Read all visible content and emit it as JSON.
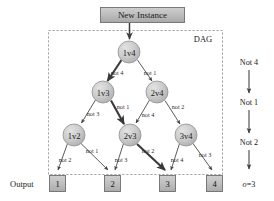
{
  "figure": {
    "background": "#ffffff",
    "node_fill": "#c6c6c6",
    "node_stroke": "#8f8f8f",
    "box_fill": "#b9b9b9",
    "box_stroke": "#7a7a7a",
    "edge_color": "#4a4a4a",
    "dashed_color": "#9a9a9a"
  },
  "input_box": {
    "label": "New Instance"
  },
  "dag_region": {
    "label": "DAG"
  },
  "output_label": {
    "text": "Output"
  },
  "nodes": [
    {
      "id": "n1v4",
      "label": "1v4",
      "cx": 129,
      "cy": 52
    },
    {
      "id": "n1v3",
      "label": "1v3",
      "cx": 103,
      "cy": 92
    },
    {
      "id": "n2v4",
      "label": "2v4",
      "cx": 157,
      "cy": 92
    },
    {
      "id": "n1v2",
      "label": "1v2",
      "cx": 74,
      "cy": 135
    },
    {
      "id": "n2v3",
      "label": "2v3",
      "cx": 130,
      "cy": 135
    },
    {
      "id": "n3v4",
      "label": "3v4",
      "cx": 186,
      "cy": 135
    }
  ],
  "outputs": [
    {
      "label": "1",
      "x": 56
    },
    {
      "label": "2",
      "x": 111
    },
    {
      "label": "3",
      "x": 166
    },
    {
      "label": "4",
      "x": 213
    }
  ],
  "edges": [
    {
      "from": "new-instance",
      "to": "n1v4",
      "label": "",
      "bold": false
    },
    {
      "from": "n1v4",
      "to": "n1v3",
      "label": "not 4",
      "bold": true
    },
    {
      "from": "n1v4",
      "to": "n2v4",
      "label": "not 1",
      "bold": false
    },
    {
      "from": "n1v3",
      "to": "n1v2",
      "label": "not 3",
      "bold": false
    },
    {
      "from": "n1v3",
      "to": "n2v3",
      "label": "not 1",
      "bold": true
    },
    {
      "from": "n2v4",
      "to": "n2v3",
      "label": "not 4",
      "bold": false
    },
    {
      "from": "n2v4",
      "to": "n3v4",
      "label": "not 2",
      "bold": false
    },
    {
      "from": "n1v2",
      "to": "out1",
      "label": "not 2",
      "bold": false
    },
    {
      "from": "n1v2",
      "to": "out2",
      "label": "not 1",
      "bold": false
    },
    {
      "from": "n2v3",
      "to": "out2",
      "label": "not 3",
      "bold": false
    },
    {
      "from": "n2v3",
      "to": "out3",
      "label": "not 2",
      "bold": true
    },
    {
      "from": "n3v4",
      "to": "out3",
      "label": "not 4",
      "bold": false
    },
    {
      "from": "n3v4",
      "to": "out4",
      "label": "not 3",
      "bold": false
    }
  ],
  "edge_labels": {
    "l1": "not 4",
    "l2": "not 1",
    "l3": "not 3",
    "l4": "not 1",
    "l5": "not 4",
    "l6": "not 2",
    "l7": "not 2",
    "l8": "not 1",
    "l9": "not 3",
    "l10": "not 2",
    "l11": "not 4",
    "l12": "not 3"
  },
  "sequence": {
    "step1": "Not 4",
    "step2": "Not 1",
    "step3": "Not 2",
    "result": "o=3",
    "result_symbol": "o",
    "result_value": "=3"
  }
}
